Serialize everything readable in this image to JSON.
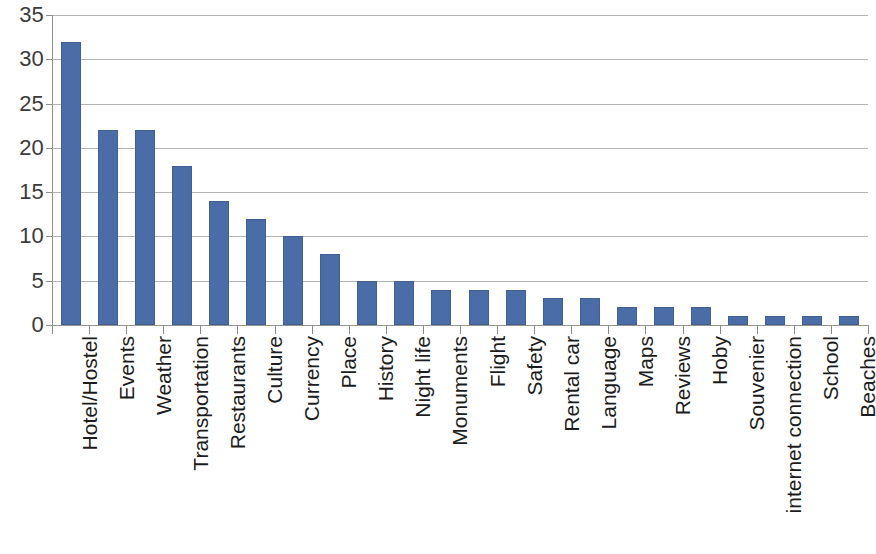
{
  "chart_data": {
    "type": "bar",
    "title": "",
    "subtitle": "",
    "xlabel": "",
    "ylabel": "",
    "ylim": [
      0,
      35
    ],
    "ytick_step": 5,
    "yticks": [
      0,
      5,
      10,
      15,
      20,
      25,
      30,
      35
    ],
    "ytick_labels": [
      "0",
      "5",
      "10",
      "15",
      "20",
      "25",
      "30",
      "35"
    ],
    "grid": "horizontal",
    "legend": "none",
    "orientation": "vertical",
    "bar_color": "#4a6da7",
    "gridline_color": "#9a9a9a",
    "axis_color": "#8d8d8d",
    "label_color": "#1c1c1c",
    "tick_label_color": "#3b3b3b",
    "xtick_label_rotation": -90,
    "categories": [
      "Hotel/Hostel",
      "Events",
      "Weather",
      "Transportation",
      "Restaurants",
      "Culture",
      "Currency",
      "Place",
      "History",
      "Night life",
      "Monuments",
      "Flight",
      "Safety",
      "Rental car",
      "Language",
      "Maps",
      "Reviews",
      "Hoby",
      "Souvenier",
      "internet connection",
      "School",
      "Beaches"
    ],
    "values": [
      32,
      22,
      22,
      18,
      14,
      12,
      10,
      8,
      5,
      5,
      4,
      4,
      4,
      3,
      3,
      2,
      2,
      2,
      1,
      1,
      1,
      1
    ]
  }
}
